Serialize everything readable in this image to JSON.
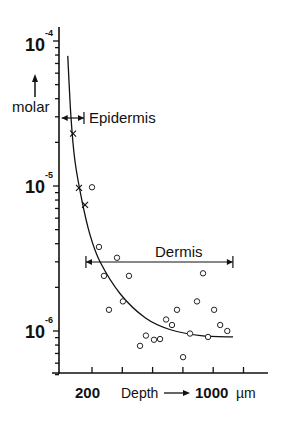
{
  "chart_data": {
    "type": "scatter",
    "title": "",
    "xlabel": "Depth",
    "xunit": "µm",
    "ylabel": "molar",
    "yscale": "log",
    "ylim": [
      5e-07,
      0.0001
    ],
    "xlim": [
      -130,
      1330
    ],
    "x_tick_values": [
      200,
      400,
      600,
      800,
      1000,
      1200
    ],
    "x_tick_labels_shown": {
      "200": "200",
      "1000": "1000"
    },
    "y_major_ticks": [
      {
        "value": 0.0001,
        "base": "10",
        "exp": "-4"
      },
      {
        "value": 1e-05,
        "base": "10",
        "exp": "-5"
      },
      {
        "value": 1e-06,
        "base": "10",
        "exp": "-6"
      }
    ],
    "grid": false,
    "series": [
      {
        "name": "Epidermis measurements",
        "marker": "cross",
        "points": [
          {
            "x": 75,
            "y": 2.3e-05
          },
          {
            "x": 114,
            "y": 9.7e-06
          },
          {
            "x": 154,
            "y": 7.4e-06
          }
        ]
      },
      {
        "name": "Dermis measurements",
        "marker": "circle",
        "points": [
          {
            "x": 200,
            "y": 9.8e-06
          },
          {
            "x": 246,
            "y": 3.8e-06
          },
          {
            "x": 365,
            "y": 3.2e-06
          },
          {
            "x": 279,
            "y": 2.4e-06
          },
          {
            "x": 444,
            "y": 2.4e-06
          },
          {
            "x": 404,
            "y": 1.6e-06
          },
          {
            "x": 312,
            "y": 1.4e-06
          },
          {
            "x": 517,
            "y": 7.9e-07
          },
          {
            "x": 556,
            "y": 9.3e-07
          },
          {
            "x": 609,
            "y": 8.7e-07
          },
          {
            "x": 649,
            "y": 8.8e-07
          },
          {
            "x": 689,
            "y": 1.2e-06
          },
          {
            "x": 728,
            "y": 1.1e-06
          },
          {
            "x": 761,
            "y": 1.4e-06
          },
          {
            "x": 801,
            "y": 6.6e-07
          },
          {
            "x": 847,
            "y": 9.6e-07
          },
          {
            "x": 893,
            "y": 1.6e-06
          },
          {
            "x": 933,
            "y": 2.5e-06
          },
          {
            "x": 966,
            "y": 9.1e-07
          },
          {
            "x": 1006,
            "y": 1.4e-06
          },
          {
            "x": 1046,
            "y": 1.1e-06
          },
          {
            "x": 1093,
            "y": 1e-06
          }
        ]
      },
      {
        "name": "Fitted curve",
        "marker": "line",
        "points": [
          {
            "x": 40,
            "y": 7.9e-05
          },
          {
            "x": 61,
            "y": 3e-05
          },
          {
            "x": 87,
            "y": 1.5e-05
          },
          {
            "x": 134,
            "y": 7.9e-06
          },
          {
            "x": 187,
            "y": 4.6e-06
          },
          {
            "x": 253,
            "y": 3e-06
          },
          {
            "x": 387,
            "y": 1.8e-06
          },
          {
            "x": 553,
            "y": 1.23e-06
          },
          {
            "x": 719,
            "y": 1.02e-06
          },
          {
            "x": 918,
            "y": 9.3e-07
          },
          {
            "x": 1131,
            "y": 9.1e-07
          }
        ]
      }
    ],
    "annotations": [
      {
        "label": "Epidermis",
        "range": [
          0,
          147
        ]
      },
      {
        "label": "Dermis",
        "range": [
          160,
          1130
        ]
      }
    ],
    "ylabel_arrow": "↑",
    "xlabel_arrow": "⟶"
  }
}
